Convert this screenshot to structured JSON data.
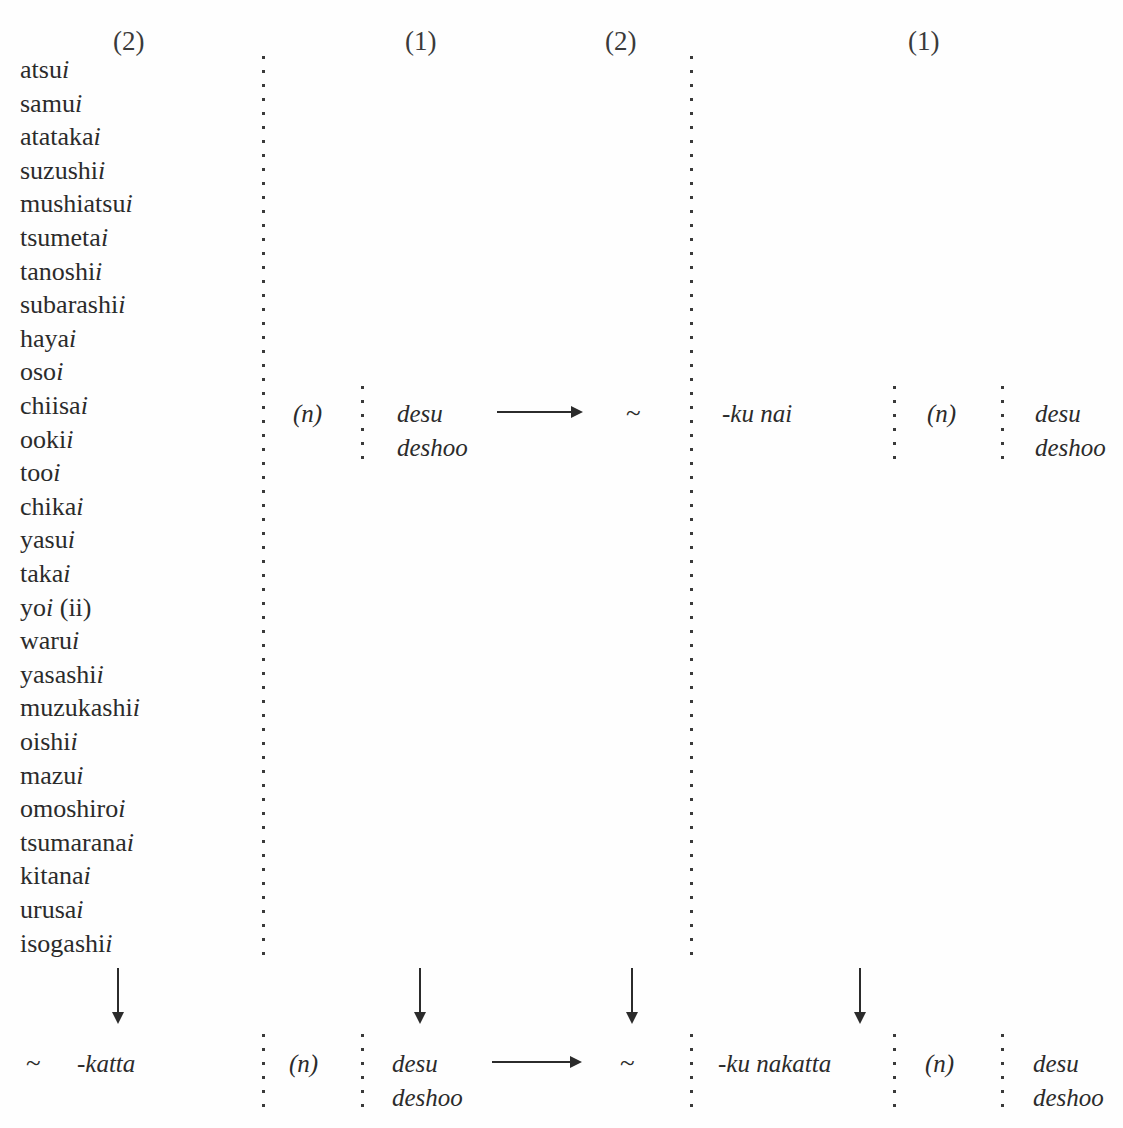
{
  "chart_data": {
    "type": "table",
    "column_headers": [
      "(2)",
      "(1)",
      "(2)",
      "(1)"
    ],
    "adjective_stems": [
      {
        "stem": "atsu",
        "suffix": "i"
      },
      {
        "stem": "samu",
        "suffix": "i"
      },
      {
        "stem": "atataka",
        "suffix": "i"
      },
      {
        "stem": "suzushi",
        "suffix": "i"
      },
      {
        "stem": "mushiatsu",
        "suffix": "i"
      },
      {
        "stem": "tsumeta",
        "suffix": "i"
      },
      {
        "stem": "tanoshi",
        "suffix": "i"
      },
      {
        "stem": "subarashi",
        "suffix": "i"
      },
      {
        "stem": "haya",
        "suffix": "i"
      },
      {
        "stem": "oso",
        "suffix": "i"
      },
      {
        "stem": "chiisa",
        "suffix": "i"
      },
      {
        "stem": "ooki",
        "suffix": "i"
      },
      {
        "stem": "too",
        "suffix": "i"
      },
      {
        "stem": "chika",
        "suffix": "i"
      },
      {
        "stem": "yasu",
        "suffix": "i"
      },
      {
        "stem": "taka",
        "suffix": "i"
      },
      {
        "stem": "yo",
        "suffix": "i",
        "note": " (ii)"
      },
      {
        "stem": "waru",
        "suffix": "i"
      },
      {
        "stem": "yasashi",
        "suffix": "i"
      },
      {
        "stem": "muzukashi",
        "suffix": "i"
      },
      {
        "stem": "oishi",
        "suffix": "i"
      },
      {
        "stem": "mazu",
        "suffix": "i"
      },
      {
        "stem": "omoshiro",
        "suffix": "i"
      },
      {
        "stem": "tsumarana",
        "suffix": "i"
      },
      {
        "stem": "kitana",
        "suffix": "i"
      },
      {
        "stem": "urusa",
        "suffix": "i"
      },
      {
        "stem": "isogashi",
        "suffix": "i"
      }
    ],
    "rows": [
      {
        "name": "nonpast-row",
        "cells": [
          "(n)",
          "desu",
          "deshoo",
          "~",
          "-ku nai",
          "(n)",
          "desu",
          "deshoo"
        ]
      },
      {
        "name": "past-row",
        "cells": [
          "~",
          "-katta",
          "(n)",
          "desu",
          "deshoo",
          "~",
          "-ku nakatta",
          "(n)",
          "desu",
          "deshoo"
        ]
      }
    ]
  },
  "headers": {
    "h1": "(2)",
    "h2": "(1)",
    "h3": "(2)",
    "h4": "(1)"
  },
  "middle_row": {
    "n_marker_1": "(n)",
    "copula_desu_1": "desu",
    "copula_deshoo_1": "deshoo",
    "tilde": "~",
    "negative": "-ku nai",
    "n_marker_2": "(n)",
    "copula_desu_2": "desu",
    "copula_deshoo_2": "deshoo"
  },
  "bottom_row": {
    "tilde_left": "~",
    "past_suffix": "-katta",
    "n_marker_1": "(n)",
    "copula_desu_1": "desu",
    "copula_deshoo_1": "deshoo",
    "tilde_right": "~",
    "negative_past": "-ku nakatta",
    "n_marker_2": "(n)",
    "copula_desu_2": "desu",
    "copula_deshoo_2": "deshoo"
  },
  "adjectives": [
    {
      "stem": "atsu",
      "i": "i",
      "note": ""
    },
    {
      "stem": "samu",
      "i": "i",
      "note": ""
    },
    {
      "stem": "atataka",
      "i": "i",
      "note": ""
    },
    {
      "stem": "suzushi",
      "i": "i",
      "note": ""
    },
    {
      "stem": "mushiatsu",
      "i": "i",
      "note": ""
    },
    {
      "stem": "tsumeta",
      "i": "i",
      "note": ""
    },
    {
      "stem": "tanoshi",
      "i": "i",
      "note": ""
    },
    {
      "stem": "subarashi",
      "i": "i",
      "note": ""
    },
    {
      "stem": "haya",
      "i": "i",
      "note": ""
    },
    {
      "stem": "oso",
      "i": "i",
      "note": ""
    },
    {
      "stem": "chiisa",
      "i": "i",
      "note": ""
    },
    {
      "stem": "ooki",
      "i": "i",
      "note": ""
    },
    {
      "stem": "too",
      "i": "i",
      "note": ""
    },
    {
      "stem": "chika",
      "i": "i",
      "note": ""
    },
    {
      "stem": "yasu",
      "i": "i",
      "note": ""
    },
    {
      "stem": "taka",
      "i": "i",
      "note": ""
    },
    {
      "stem": "yo",
      "i": "i",
      "note": " (ii)"
    },
    {
      "stem": "waru",
      "i": "i",
      "note": ""
    },
    {
      "stem": "yasashi",
      "i": "i",
      "note": ""
    },
    {
      "stem": "muzukashi",
      "i": "i",
      "note": ""
    },
    {
      "stem": "oishi",
      "i": "i",
      "note": ""
    },
    {
      "stem": "mazu",
      "i": "i",
      "note": ""
    },
    {
      "stem": "omoshiro",
      "i": "i",
      "note": ""
    },
    {
      "stem": "tsumarana",
      "i": "i",
      "note": ""
    },
    {
      "stem": "kitana",
      "i": "i",
      "note": ""
    },
    {
      "stem": "urusa",
      "i": "i",
      "note": ""
    },
    {
      "stem": "isogashi",
      "i": "i",
      "note": ""
    }
  ],
  "colors": {
    "ink": "#2b2b2b",
    "rule": "#3a3a3a",
    "paper": "#fefefe"
  }
}
